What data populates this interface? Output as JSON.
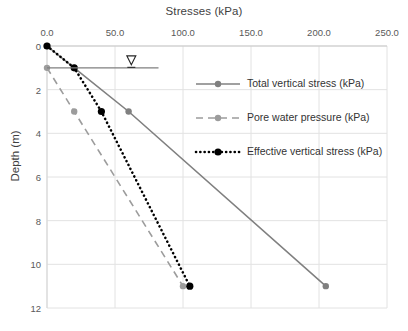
{
  "chart_data": {
    "type": "line",
    "title": "",
    "xlabel": "Stresses (kPa)",
    "ylabel": "Depth (m)",
    "xlim": [
      0,
      250
    ],
    "ylim": [
      0,
      12
    ],
    "y_inverted": true,
    "xticks": [
      "0.0",
      "50.0",
      "100.0",
      "150.0",
      "200.0",
      "250.0"
    ],
    "xtick_values": [
      0,
      50,
      100,
      150,
      200,
      250
    ],
    "yticks": [
      "0",
      "2",
      "4",
      "6",
      "8",
      "10",
      "12"
    ],
    "ytick_values": [
      0,
      2,
      4,
      6,
      8,
      10,
      12
    ],
    "grid": true,
    "legend_position": "inside-upper-right",
    "series": [
      {
        "name": "Total vertical stress (kPa)",
        "color": "#808080",
        "style": "solid",
        "marker": "circle",
        "x": [
          0,
          20,
          60,
          205
        ],
        "y": [
          0,
          1,
          3,
          11
        ]
      },
      {
        "name": "Pore water pressure (kPa)",
        "color": "#9c9c9c",
        "style": "dashed",
        "marker": "circle",
        "x": [
          0,
          20,
          100
        ],
        "y": [
          1,
          3,
          11
        ]
      },
      {
        "name": "Effective vertical stress (kPa)",
        "color": "#000000",
        "style": "dotted",
        "marker": "circle",
        "x": [
          0,
          20,
          40,
          105
        ],
        "y": [
          0,
          1,
          3,
          11
        ]
      }
    ],
    "annotations": [
      {
        "name": "water-table",
        "type": "water-table-line",
        "label": "",
        "depth": 1,
        "x_start": 0,
        "x_end": 82,
        "symbol_x": 62,
        "color": "#7f7f7f"
      }
    ]
  },
  "legend": {
    "items": [
      {
        "label": "Total vertical stress (kPa)"
      },
      {
        "label": "Pore water pressure (kPa)"
      },
      {
        "label": "Effective vertical stress (kPa)"
      }
    ]
  }
}
